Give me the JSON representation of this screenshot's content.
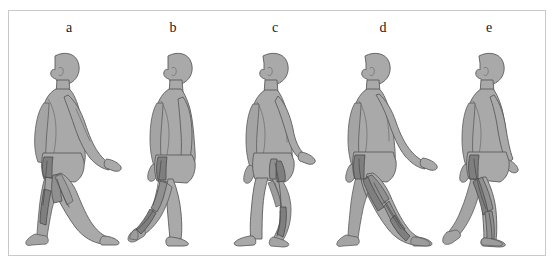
{
  "figure": {
    "border_color": "#8e8e8e",
    "background_color": "#ffffff",
    "body_fill_color": "#a9a9a9",
    "body_outline_color": "#5c5c5c",
    "muscle_highlight_color": "#7f7f7f",
    "panel_count": 5,
    "panels": [
      {
        "label": "a",
        "caption": "Walking figure, left side view, mid-stance with forward leg extended; highlighted hip and thigh musculature with shaded lower leg",
        "highlighted_regions": [
          "hip flexor",
          "quadriceps",
          "tibialis anterior"
        ]
      },
      {
        "label": "b",
        "caption": "Walking figure, left side view, trailing leg flexed at knee with heel raised; highlighted hip and posterior lower leg musculature",
        "highlighted_regions": [
          "hip flexor",
          "hamstring",
          "gastrocnemius"
        ]
      },
      {
        "label": "c",
        "caption": "Walking figure, left side view, near-upright with trailing knee flexed; highlighted hip and calf musculature",
        "highlighted_regions": [
          "gluteal",
          "hip flexor",
          "calf"
        ]
      },
      {
        "label": "d",
        "caption": "Walking figure, left side view, long stride with forward heel strike; strongly highlighted thigh and lower leg musculature",
        "highlighted_regions": [
          "quadriceps",
          "tibialis anterior",
          "foot dorsum"
        ]
      },
      {
        "label": "e",
        "caption": "Walking figure, left side view, mid-swing with forward foot flat; highlighted hip, thigh and shin musculature",
        "highlighted_regions": [
          "hip flexor",
          "quadriceps",
          "tibialis anterior"
        ]
      }
    ]
  }
}
